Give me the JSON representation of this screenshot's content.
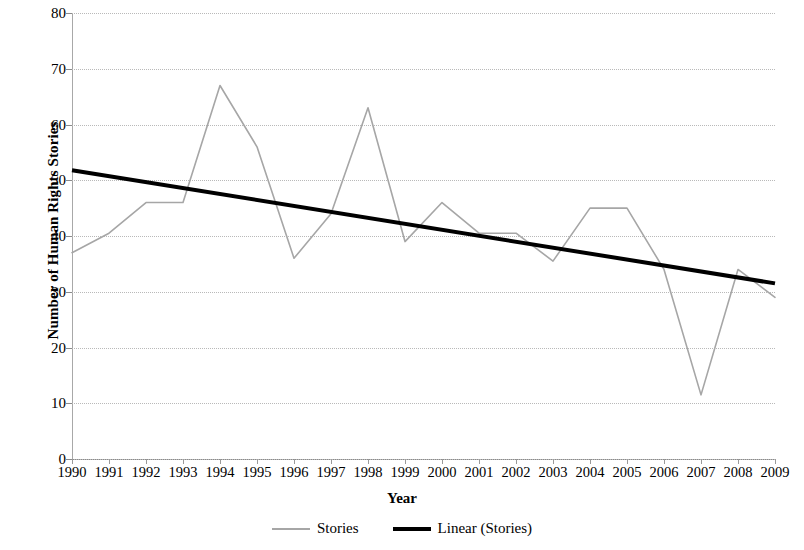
{
  "chart_data": {
    "type": "line",
    "title": "",
    "xlabel": "Year",
    "ylabel": "Number of Human Rights Stories",
    "x": [
      1990,
      1991,
      1992,
      1993,
      1994,
      1995,
      1996,
      1997,
      1998,
      1999,
      2000,
      2001,
      2002,
      2003,
      2004,
      2005,
      2006,
      2007,
      2008,
      2009
    ],
    "xtick_labels": [
      "1990",
      "1991",
      "1992",
      "1993",
      "1994",
      "1995",
      "1996",
      "1997",
      "1998",
      "1999",
      "2000",
      "2001",
      "2002",
      "2003",
      "2004",
      "2005",
      "2006",
      "2007",
      "2008",
      "2009"
    ],
    "ytick_labels": [
      "0",
      "10",
      "20",
      "30",
      "40",
      "50",
      "60",
      "70",
      "80"
    ],
    "yticks": [
      0,
      10,
      20,
      30,
      40,
      50,
      60,
      70,
      80
    ],
    "ylim": [
      0,
      80
    ],
    "xlim": [
      1990,
      2009
    ],
    "grid": "horizontal",
    "legend_position": "bottom",
    "series": [
      {
        "name": "Stories",
        "type": "line",
        "color": "#a6a6a6",
        "width": 1.6,
        "values": [
          37,
          40.5,
          46,
          46,
          67,
          56,
          36,
          44,
          63,
          39,
          46,
          40.5,
          40.5,
          35.5,
          45,
          45,
          34,
          11.5,
          34,
          29
        ]
      },
      {
        "name": "Linear (Stories)",
        "type": "trendline",
        "color": "#000000",
        "width": 4,
        "start_value": 51.8,
        "end_value": 31.5
      }
    ]
  },
  "legend": {
    "items": [
      {
        "label": "Stories"
      },
      {
        "label": "Linear (Stories)"
      }
    ]
  },
  "axes": {
    "y_title": "Number of Human Rights Stories",
    "x_title": "Year"
  }
}
